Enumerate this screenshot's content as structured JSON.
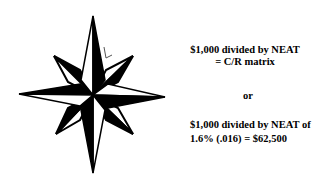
{
  "slide": {
    "graphic": {
      "icon": "compass-rose-icon",
      "colors": {
        "fill": "#000000",
        "background": "#ffffff"
      }
    },
    "formula_1": {
      "line_1": "$1,000 divided by NEAT",
      "line_2": "= C/R matrix"
    },
    "separator": "or",
    "formula_2": {
      "line_1": "$1,000 divided by NEAT of",
      "line_2": "1.6% (.016) = $62,500"
    }
  }
}
